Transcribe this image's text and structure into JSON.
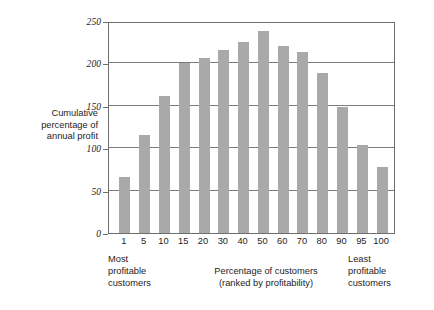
{
  "chart_data": {
    "type": "bar",
    "title": "",
    "subtitle": "",
    "xlabel": "Percentage of customers (ranked by profitability)",
    "ylabel": "Cumulative percentage of annual profit",
    "categories": [
      "1",
      "5",
      "10",
      "15",
      "20",
      "30",
      "40",
      "50",
      "60",
      "70",
      "80",
      "90",
      "95",
      "100"
    ],
    "values": [
      66,
      116,
      161,
      200,
      206,
      216,
      225,
      238,
      221,
      213,
      189,
      149,
      104,
      78
    ],
    "ylim": [
      0,
      250
    ],
    "yticks": [
      0,
      50,
      100,
      150,
      200,
      250
    ],
    "ytick_labels": [
      "0",
      "50",
      "100",
      "150",
      "200",
      "250"
    ],
    "grid": "horizontal",
    "legend": "none",
    "bar_color": "#a9a9a9",
    "axis_color": "#6e6e6e",
    "background": "#ffffff"
  },
  "axis_title_y": {
    "line1": "Cumulative",
    "line2": "percentage of",
    "line3": "annual profit"
  },
  "annotations": {
    "left": {
      "line1": "Most",
      "line2": "profitable",
      "line3": "customers"
    },
    "center": {
      "line1": "Percentage of customers",
      "line2": "(ranked by profitability)"
    },
    "right": {
      "line1": "Least",
      "line2": "profitable",
      "line3": "customers"
    }
  }
}
